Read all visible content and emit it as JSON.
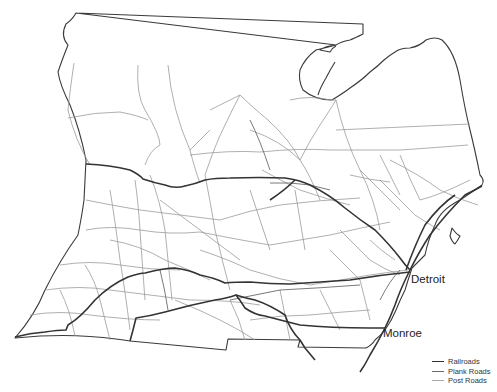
{
  "map": {
    "title": "",
    "cities": [
      {
        "name": "Detroit",
        "x": 411,
        "y": 273
      },
      {
        "name": "Monroe",
        "x": 383,
        "y": 334
      }
    ],
    "legend": {
      "items": [
        {
          "label": "Railroads",
          "color": "#333333",
          "width": 1.6
        },
        {
          "label": "Plank Roads",
          "color": "#6a6a6a",
          "width": 0.9
        },
        {
          "label": "Post Roads",
          "color": "#aaaaaa",
          "width": 0.8
        }
      ]
    }
  }
}
